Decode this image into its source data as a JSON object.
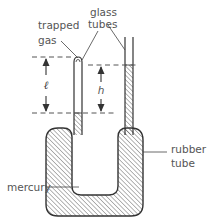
{
  "diagram": {
    "title": "",
    "labels": {
      "trapped_gas_line1": "trapped",
      "trapped_gas_line2": "gas",
      "glass_tubes_line1": "glass",
      "glass_tubes_line2": "tubes",
      "rubber_tube_line1": "rubber",
      "rubber_tube_line2": "tube",
      "mercury": "mercury",
      "length_symbol": "ℓ",
      "height_symbol": "h"
    },
    "components": [
      {
        "id": "left-glass-tube",
        "type": "glass tube",
        "end": "closed",
        "contains": "trapped gas above mercury"
      },
      {
        "id": "right-glass-tube",
        "type": "glass tube",
        "end": "open",
        "contains": "mercury"
      },
      {
        "id": "rubber-tube",
        "type": "flexible U-tube",
        "contains": "mercury"
      }
    ],
    "dimensions": [
      {
        "symbol": "ℓ",
        "meaning": "length of trapped gas column"
      },
      {
        "symbol": "h",
        "meaning": "height difference of mercury levels"
      }
    ],
    "colors": {
      "stroke": "#333333",
      "hatch": "#555555",
      "text": "#555555",
      "background": "#ffffff"
    }
  }
}
